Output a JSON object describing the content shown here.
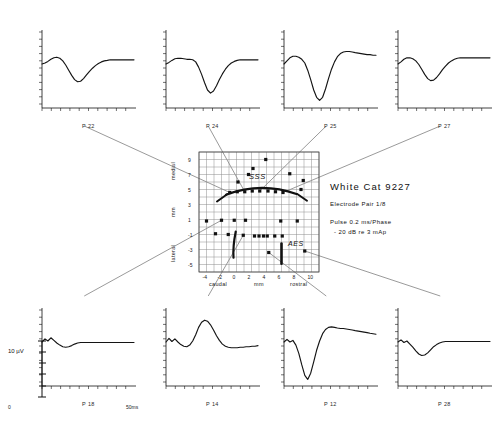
{
  "figure": {
    "kind": "cortical-evoked-potential-map",
    "scale_bar_label": "10 µV",
    "time_axis_label": "50ms",
    "time_zero_label": "0"
  },
  "info": {
    "title": "White Cat 9227",
    "line1": "Electrode  Pair  1/8",
    "line2": "Pulse  0.2  ms/Phase",
    "line3": "- 20 dB re 3 mAp"
  },
  "map": {
    "landmark_sss": "SSS",
    "landmark_aes": "AES",
    "x_axis_label": "mm",
    "x_axis_left": "caudal",
    "x_axis_right": "rostral",
    "y_axis_label": "mm",
    "y_axis_top": "medial",
    "y_axis_bottom": "lateral",
    "x_ticks": [
      "-4",
      "-2",
      "0",
      "2",
      "4",
      "6",
      "8",
      "10"
    ],
    "y_ticks": [
      "9",
      "7",
      "5",
      "3",
      "1",
      "-1",
      "-3",
      "-5"
    ],
    "xlim": [
      -5,
      11
    ],
    "ylim": [
      -6,
      10
    ],
    "sites": [
      {
        "x": -4.0,
        "y": 0.8
      },
      {
        "x": -2.8,
        "y": -0.9
      },
      {
        "x": -2.0,
        "y": 0.9
      },
      {
        "x": -1.1,
        "y": -1.0
      },
      {
        "x": -0.9,
        "y": 4.6
      },
      {
        "x": -0.3,
        "y": 0.9
      },
      {
        "x": 0.1,
        "y": 4.7
      },
      {
        "x": 0.2,
        "y": 6.0
      },
      {
        "x": 0.9,
        "y": -1.1
      },
      {
        "x": 1.1,
        "y": 4.7
      },
      {
        "x": 1.2,
        "y": 0.9
      },
      {
        "x": 1.6,
        "y": 7.0
      },
      {
        "x": 2.1,
        "y": 4.8
      },
      {
        "x": 2.2,
        "y": 7.8
      },
      {
        "x": 2.4,
        "y": -1.2
      },
      {
        "x": 3.0,
        "y": -1.2
      },
      {
        "x": 3.1,
        "y": 4.8
      },
      {
        "x": 3.6,
        "y": -1.2
      },
      {
        "x": 3.9,
        "y": 9.0
      },
      {
        "x": 4.1,
        "y": -1.2
      },
      {
        "x": 4.2,
        "y": 4.8
      },
      {
        "x": 4.3,
        "y": -3.4
      },
      {
        "x": 5.1,
        "y": -1.2
      },
      {
        "x": 5.2,
        "y": 4.7
      },
      {
        "x": 5.9,
        "y": 0.8
      },
      {
        "x": 6.1,
        "y": -1.2
      },
      {
        "x": 6.2,
        "y": 4.6
      },
      {
        "x": 7.1,
        "y": 7.1
      },
      {
        "x": 8.1,
        "y": 0.8
      },
      {
        "x": 8.6,
        "y": 5.0
      },
      {
        "x": 8.9,
        "y": 6.2
      },
      {
        "x": 9.1,
        "y": -3.2
      }
    ]
  },
  "panels": [
    {
      "id": "p22",
      "label": "P 22",
      "pos": "top",
      "slot": 0,
      "link_site": {
        "x": -0.9,
        "y": 4.6
      },
      "trace": [
        0,
        2,
        5,
        9,
        12,
        13,
        11,
        6,
        -2,
        -12,
        -22,
        -30,
        -34,
        -33,
        -28,
        -21,
        -14,
        -8,
        -3,
        1,
        4,
        6,
        7,
        8,
        8,
        8,
        8,
        8,
        8,
        8,
        8,
        8
      ]
    },
    {
      "id": "p24",
      "label": "P 24",
      "pos": "top",
      "slot": 1,
      "link_site": {
        "x": 1.1,
        "y": 4.7
      },
      "trace": [
        0,
        3,
        7,
        10,
        11,
        11,
        10,
        9,
        9,
        8,
        4,
        -6,
        -20,
        -36,
        -50,
        -56,
        -52,
        -42,
        -30,
        -19,
        -10,
        -3,
        2,
        5,
        7,
        8,
        8,
        8,
        8,
        8,
        8,
        8
      ]
    },
    {
      "id": "p25",
      "label": "P 25",
      "pos": "top",
      "slot": 2,
      "link_site": {
        "x": 3.1,
        "y": 4.8
      },
      "trace": [
        0,
        6,
        12,
        15,
        15,
        13,
        9,
        2,
        -12,
        -30,
        -50,
        -64,
        -70,
        -64,
        -48,
        -28,
        -10,
        4,
        14,
        20,
        23,
        24,
        24,
        23,
        22,
        21,
        20,
        19,
        18,
        18,
        17,
        17
      ]
    },
    {
      "id": "p27",
      "label": "P 27",
      "pos": "top",
      "slot": 3,
      "link_site": {
        "x": 6.2,
        "y": 4.6
      },
      "trace": [
        0,
        4,
        9,
        12,
        12,
        10,
        6,
        -1,
        -10,
        -20,
        -28,
        -32,
        -31,
        -26,
        -19,
        -11,
        -4,
        2,
        6,
        9,
        11,
        12,
        12,
        12,
        12,
        12,
        12,
        12,
        12,
        12,
        12,
        12
      ]
    },
    {
      "id": "p18",
      "label": "P 18",
      "pos": "bottom",
      "slot": 0,
      "link_site": {
        "x": -2.0,
        "y": 0.9
      },
      "trace": [
        0,
        6,
        2,
        8,
        3,
        -2,
        -6,
        -9,
        -10,
        -9,
        -7,
        -4,
        -2,
        -1,
        -1,
        -1,
        -1,
        -1,
        -1,
        -1,
        -1,
        -1,
        -1,
        -1,
        -1,
        -1,
        -1,
        -1,
        -1,
        -1,
        -1,
        -1
      ]
    },
    {
      "id": "p14",
      "label": "P 14",
      "pos": "bottom",
      "slot": 1,
      "link_site": {
        "x": 0.9,
        "y": -1.1
      },
      "trace": [
        0,
        7,
        1,
        6,
        0,
        -5,
        -8,
        -9,
        -6,
        2,
        14,
        28,
        38,
        42,
        40,
        33,
        23,
        12,
        3,
        -4,
        -8,
        -10,
        -11,
        -11,
        -11,
        -10,
        -10,
        -9,
        -9,
        -8,
        -8,
        -7
      ]
    },
    {
      "id": "p12",
      "label": "P 12",
      "pos": "bottom",
      "slot": 2,
      "link_site": {
        "x": 4.3,
        "y": -3.4
      },
      "trace": [
        0,
        5,
        0,
        3,
        -6,
        -22,
        -44,
        -64,
        -72,
        -60,
        -38,
        -16,
        2,
        16,
        24,
        28,
        29,
        28,
        27,
        26,
        26,
        25,
        24,
        23,
        22,
        21,
        20,
        19,
        18,
        17,
        16,
        15
      ]
    },
    {
      "id": "p28",
      "label": "P 28",
      "pos": "bottom",
      "slot": 3,
      "link_site": {
        "x": 9.1,
        "y": -3.2
      },
      "trace": [
        0,
        4,
        -1,
        2,
        -4,
        -10,
        -17,
        -23,
        -26,
        -25,
        -21,
        -15,
        -9,
        -5,
        -2,
        0,
        1,
        1,
        1,
        1,
        1,
        1,
        1,
        1,
        1,
        1,
        1,
        1,
        1,
        1,
        1,
        1
      ]
    }
  ]
}
